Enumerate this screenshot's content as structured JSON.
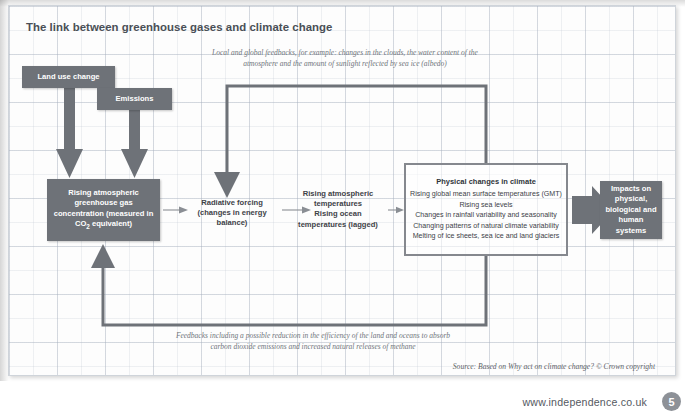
{
  "title": "The link between greenhouse gases and climate change",
  "colors": {
    "box_fill": "#6e7278",
    "box_text": "#ffffff",
    "connector": "#6e7278",
    "outline_box_border": "#85888e",
    "annotation_text": "#70757c",
    "title_text": "#4a4f56",
    "grid_line": "#a0aab9",
    "badge_fill": "#8d9197"
  },
  "boxes": {
    "land_use": "Land use change",
    "emissions": "Emissions",
    "ghg_concentration": "Rising atmospheric greenhouse gas concentration (measured in CO₂ equivalent)",
    "radiative_forcing": "Radiative forcing (changes in energy balance)",
    "temperatures": "Rising atmospheric temperatures Rising ocean temperatures (lagged)",
    "impacts": "Impacts on physical, biological and human systems"
  },
  "physical_changes": {
    "heading": "Physical changes in climate",
    "items": [
      "Rising global mean surface temperatures (GMT)",
      "Rising sea levels",
      "Changes in rainfall variability and seasonality",
      "Changing patterns of natural climate variability",
      "Melting of ice sheets, sea ice and land glaciers"
    ]
  },
  "annotations": {
    "top": "Local and global feedbacks, for example: changes in the clouds, the water content of the atmosphere and the amount of sunlight reflected by sea ice (albedo)",
    "bottom": "Feedbacks including a possible reduction in the efficiency of the land and oceans to absorb carbon dioxide emissions and increased natural releases of methane"
  },
  "source": "Source: Based on Why act on climate change? © Crown copyright",
  "footer": {
    "url": "www.independence.co.uk",
    "page_number": "5"
  }
}
